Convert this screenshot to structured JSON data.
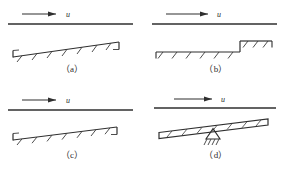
{
  "figure": {
    "width": 288,
    "height": 172,
    "background": "#ffffff",
    "ink_color": "#2f2f2f",
    "panel_count": 4
  },
  "panels": [
    {
      "id": "a",
      "caption": "（a）",
      "velocity_label": "u",
      "arrow_direction": "right",
      "geometry": "inclined-flat-plate-rising",
      "description": "Horizontal free-stream line above an upward-sloping hatched wall with vertical end caps"
    },
    {
      "id": "b",
      "caption": "（b）",
      "velocity_label": "u",
      "arrow_direction": "right",
      "geometry": "forward-facing-step",
      "description": "Horizontal free-stream line above a flat hatched wall with an upward step near the right end"
    },
    {
      "id": "c",
      "caption": "（c）",
      "velocity_label": "u",
      "arrow_direction": "right",
      "geometry": "inclined-flat-plate-rising",
      "description": "Horizontal free-stream line above an upward-sloping hatched wall with vertical end caps"
    },
    {
      "id": "d",
      "caption": "（d）",
      "velocity_label": "u",
      "arrow_direction": "right",
      "geometry": "tilted-plate-on-pivot",
      "description": "Horizontal free-stream line above a tilted hatched flat plate supported on a triangular pivot"
    }
  ]
}
